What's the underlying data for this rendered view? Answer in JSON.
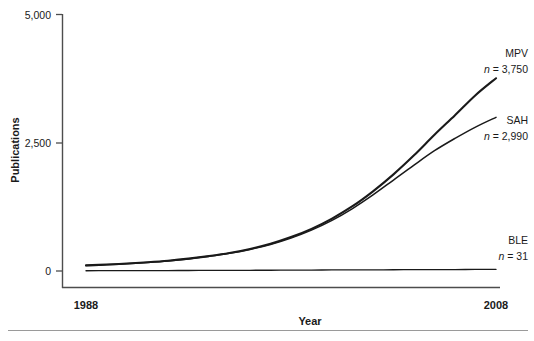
{
  "chart_data": {
    "type": "line",
    "title": "",
    "xlabel": "Year",
    "ylabel": "Publications",
    "xlim": [
      1988,
      2008
    ],
    "ylim": [
      0,
      5000
    ],
    "xticks": [
      "1988",
      "2008"
    ],
    "yticks": [
      "0",
      "2,500",
      "5,000"
    ],
    "ytick_values": [
      0,
      2500,
      5000
    ],
    "grid": false,
    "legend_position": "right-inline",
    "x": [
      1988,
      1989,
      1990,
      1991,
      1992,
      1993,
      1994,
      1995,
      1996,
      1997,
      1998,
      1999,
      2000,
      2001,
      2002,
      2003,
      2004,
      2005,
      2006,
      2007,
      2008
    ],
    "series": [
      {
        "name": "MPV",
        "label": "MPV",
        "n_prefix": "n",
        "n_equals": " = ",
        "n_value": "3,750",
        "n_label": "n = 3,750",
        "color": "#1a1a1a",
        "values": [
          110,
          125,
          145,
          170,
          200,
          240,
          290,
          350,
          430,
          530,
          660,
          820,
          1020,
          1260,
          1550,
          1880,
          2250,
          2650,
          3030,
          3420,
          3750
        ]
      },
      {
        "name": "SAH",
        "label": "SAH",
        "n_prefix": "n",
        "n_equals": " = ",
        "n_value": "2,990",
        "n_label": "n = 2,990",
        "color": "#1a1a1a",
        "values": [
          105,
          120,
          140,
          165,
          195,
          235,
          285,
          345,
          420,
          515,
          640,
          795,
          985,
          1215,
          1480,
          1770,
          2060,
          2340,
          2580,
          2800,
          2990
        ]
      },
      {
        "name": "BLE",
        "label": "BLE",
        "n_prefix": "n",
        "n_equals": " = ",
        "n_value": "31",
        "n_label": "n = 31",
        "color": "#1a1a1a",
        "values": [
          5,
          6,
          7,
          8,
          9,
          10,
          11,
          12,
          14,
          15,
          17,
          18,
          20,
          21,
          23,
          24,
          26,
          27,
          28,
          30,
          31
        ]
      }
    ]
  },
  "axes": {
    "y_title": "Publications",
    "x_title": "Year",
    "y_tick_0": "0",
    "y_tick_1": "2,500",
    "y_tick_2": "5,000",
    "x_tick_0": "1988",
    "x_tick_1": "2008"
  },
  "colors": {
    "line": "#1a1a1a",
    "axis": "#4d4d4d",
    "rule": "#9a9a9a",
    "text": "#1a1a1a"
  }
}
